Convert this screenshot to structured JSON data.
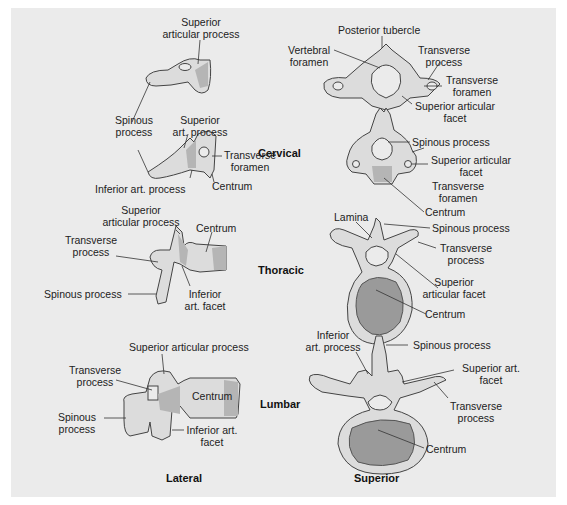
{
  "figure": {
    "background": "#ebebeb",
    "views": {
      "lateral": "Lateral",
      "superior": "Superior"
    },
    "regions": {
      "cervical": "Cervical",
      "thoracic": "Thoracic",
      "lumbar": "Lumbar"
    },
    "cervical_lateral": {
      "superior_articular_process": [
        "Superior",
        "articular process"
      ],
      "spinous_process": [
        "Spinous",
        "process"
      ],
      "superior_art_process": [
        "Superior",
        "art. process"
      ],
      "transverse_foramen": [
        "Transverse",
        "foramen"
      ],
      "inferior_art_process": "Inferior art. process",
      "centrum": "Centrum"
    },
    "cervical_superior_atlas": {
      "posterior_tubercle": "Posterior tubercle",
      "vertebral_foramen": [
        "Vertebral",
        "foramen"
      ],
      "transverse_process": [
        "Transverse",
        "process"
      ],
      "transverse_foramen": [
        "Transverse",
        "foramen"
      ],
      "superior_articular_facet": [
        "Superior articular",
        "facet"
      ]
    },
    "cervical_superior": {
      "spinous_process": "Spinous process",
      "superior_articular_facet": [
        "Superior articular",
        "facet"
      ],
      "transverse_foramen": [
        "Transverse",
        "foramen"
      ],
      "centrum": "Centrum"
    },
    "thoracic_lateral": {
      "superior_articular_process": [
        "Superior",
        "articular process"
      ],
      "centrum": "Centrum",
      "transverse_process": [
        "Transverse",
        "process"
      ],
      "spinous_process": "Spinous process",
      "inferior_art_facet": [
        "Inferior",
        "art. facet"
      ]
    },
    "thoracic_superior": {
      "lamina": "Lamina",
      "spinous_process": "Spinous process",
      "transverse_process": [
        "Transverse",
        "process"
      ],
      "superior_articular_facet": [
        "Superior",
        "articular facet"
      ],
      "centrum": "Centrum"
    },
    "lumbar_lateral": {
      "superior_articular_process": "Superior articular process",
      "transverse_process": [
        "Transverse",
        "process"
      ],
      "centrum": "Centrum",
      "spinous_process": [
        "Spinous",
        "process"
      ],
      "inferior_art_facet": [
        "Inferior art.",
        "facet"
      ]
    },
    "lumbar_superior": {
      "inferior_art_process": [
        "Inferior",
        "art. process"
      ],
      "spinous_process": "Spinous process",
      "superior_art_facet": [
        "Superior art.",
        "facet"
      ],
      "transverse_process": [
        "Transverse",
        "process"
      ],
      "centrum": "Centrum"
    }
  }
}
